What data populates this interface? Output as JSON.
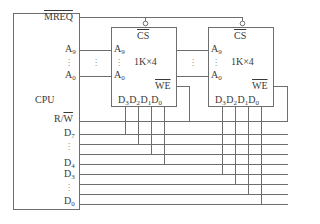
{
  "cpu": {
    "label": "CPU",
    "mreq": "MREQ",
    "addr_high": {
      "base": "A",
      "sub": "9"
    },
    "addr_low": {
      "base": "A",
      "sub": "0"
    },
    "rw": {
      "r": "R/",
      "w": "W"
    },
    "data_labels": [
      {
        "base": "D",
        "sub": "7"
      },
      {
        "base": "D",
        "sub": "4"
      },
      {
        "base": "D",
        "sub": "3"
      },
      {
        "base": "D",
        "sub": "0"
      }
    ]
  },
  "chips": [
    {
      "cs": "CS",
      "size": "1K×4",
      "addr_high": {
        "base": "A",
        "sub": "9"
      },
      "addr_low": {
        "base": "A",
        "sub": "0"
      },
      "we": "WE",
      "data_pins": [
        {
          "base": "D",
          "sub": "3"
        },
        {
          "base": "D",
          "sub": "2"
        },
        {
          "base": "D",
          "sub": "1"
        },
        {
          "base": "D",
          "sub": "0"
        }
      ],
      "connects_to": "D7–D4"
    },
    {
      "cs": "CS",
      "size": "1K×4",
      "addr_high": {
        "base": "A",
        "sub": "9"
      },
      "addr_low": {
        "base": "A",
        "sub": "0"
      },
      "we": "WE",
      "data_pins": [
        {
          "base": "D",
          "sub": "3"
        },
        {
          "base": "D",
          "sub": "2"
        },
        {
          "base": "D",
          "sub": "1"
        },
        {
          "base": "D",
          "sub": "0"
        }
      ],
      "connects_to": "D3–D0"
    }
  ],
  "ellipsis": "⋮",
  "colors": {
    "line": "#6e6e6e",
    "text": "#3a3a3a"
  }
}
